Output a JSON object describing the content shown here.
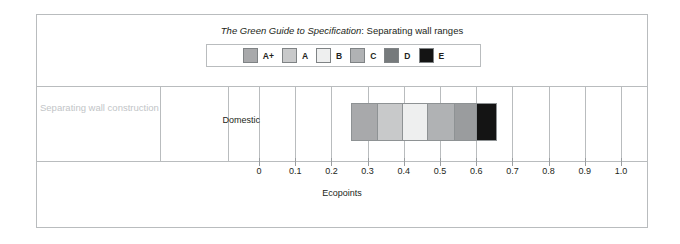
{
  "title": {
    "emphasis": "The Green Guide to Specification",
    "rest": ": Separating wall ranges"
  },
  "legend": {
    "items": [
      {
        "label": "A+",
        "color": "#a8a9ab"
      },
      {
        "label": "A",
        "color": "#c8c9ca"
      },
      {
        "label": "B",
        "color": "#eeefef"
      },
      {
        "label": "C",
        "color": "#b0b2b4"
      },
      {
        "label": "D",
        "color": "#767a7c"
      },
      {
        "label": "E",
        "color": "#141414"
      }
    ]
  },
  "row": {
    "category": "Separating wall construction",
    "subcategory": "Domestic"
  },
  "axis": {
    "title": "Ecopoints",
    "ticks": [
      "0",
      "0.1",
      "0.2",
      "0.3",
      "0.4",
      "0.5",
      "0.6",
      "0.7",
      "0.8",
      "0.9",
      "1.0"
    ],
    "values": [
      0,
      0.1,
      0.2,
      0.3,
      0.4,
      0.5,
      0.6,
      0.7,
      0.8,
      0.9,
      1.0
    ]
  },
  "chart_data": {
    "type": "bar",
    "orientation": "horizontal",
    "title": "The Green Guide to Specification: Separating wall ranges",
    "xlabel": "Ecopoints",
    "ylabel": "",
    "xlim": [
      0,
      1.0
    ],
    "grid": true,
    "legend_position": "top-center",
    "categories": [
      "Separating wall construction - Domestic"
    ],
    "series": [
      {
        "name": "A+",
        "start": 0.255,
        "end": 0.325,
        "value": 0.07,
        "color": "#a8a9ab"
      },
      {
        "name": "A",
        "start": 0.325,
        "end": 0.395,
        "value": 0.07,
        "color": "#c8c9ca"
      },
      {
        "name": "B",
        "start": 0.395,
        "end": 0.465,
        "value": 0.07,
        "color": "#eeefef"
      },
      {
        "name": "C",
        "start": 0.465,
        "end": 0.54,
        "value": 0.075,
        "color": "#b0b2b4"
      },
      {
        "name": "D",
        "start": 0.54,
        "end": 0.6,
        "value": 0.06,
        "color": "#9a9c9e"
      },
      {
        "name": "E",
        "start": 0.6,
        "end": 0.658,
        "value": 0.058,
        "color": "#141414"
      }
    ],
    "total_range": [
      0.255,
      0.658
    ]
  }
}
